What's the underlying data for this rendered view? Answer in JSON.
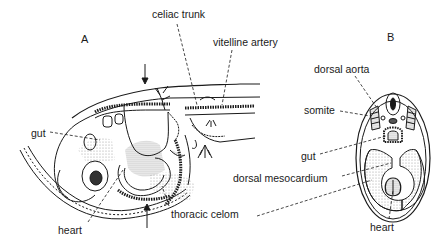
{
  "figure": {
    "panels": [
      {
        "letter": "A",
        "description": "sagittal section of embryo"
      },
      {
        "letter": "B",
        "description": "transverse cross-section"
      }
    ],
    "labels_a": {
      "celiac_trunk": "celiac trunk",
      "vitelline_artery": "vitelline artery",
      "gut": "gut",
      "heart": "heart",
      "thoracic_celom": "thoracic celom"
    },
    "labels_b": {
      "dorsal_aorta": "dorsal aorta",
      "somite": "somite",
      "gut": "gut",
      "dorsal_mesocardium": "dorsal mesocardium",
      "heart": "heart"
    },
    "colors": {
      "line": "#1a1a1a",
      "stipple": "#9a9a9a",
      "background": "#ffffff"
    }
  }
}
